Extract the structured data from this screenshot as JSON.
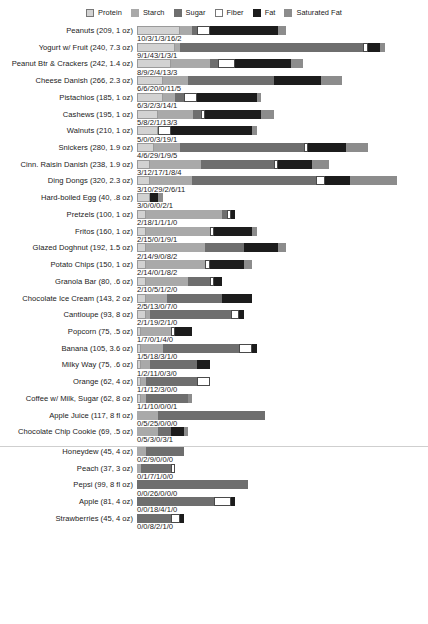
{
  "legend": {
    "items": [
      {
        "label": "Protein",
        "color": "#d2d2d2",
        "key": "protein"
      },
      {
        "label": "Starch",
        "color": "#a9a9a9",
        "key": "starch"
      },
      {
        "label": "Sugar",
        "color": "#6e6e6e",
        "key": "sugar"
      },
      {
        "label": "Fiber",
        "color": "#ffffff",
        "key": "fiber"
      },
      {
        "label": "Fat",
        "color": "#1c1c1c",
        "key": "fat"
      },
      {
        "label": "Saturated Fat",
        "color": "#8c8c8c",
        "key": "satfat"
      }
    ]
  },
  "chart_data": {
    "type": "bar",
    "title": "",
    "subtitle": "",
    "xlabel": "",
    "ylabel": "",
    "orientation": "horizontal",
    "stacked": true,
    "grid": false,
    "legend_position": "top-center",
    "units": "grams",
    "value_separator": "/",
    "px_per_unit": 4.27,
    "series": [
      {
        "name": "Protein",
        "color": "#d2d2d2"
      },
      {
        "name": "Starch",
        "color": "#a9a9a9"
      },
      {
        "name": "Sugar",
        "color": "#6e6e6e"
      },
      {
        "name": "Fiber",
        "color": "#ffffff"
      },
      {
        "name": "Fat",
        "color": "#1c1c1c"
      },
      {
        "name": "Saturated Fat",
        "color": "#8c8c8c"
      }
    ],
    "categories": [
      "Peanuts (209, 1 oz)",
      "Yogurt w/ Fruit (240, 7.3 oz)",
      "Peanut Btr & Crackers (242, 1.4 oz)",
      "Cheese Danish (266, 2.3 oz)",
      "Pistachios (185, 1 oz)",
      "Cashews (195, 1 oz)",
      "Walnuts (210, 1 oz)",
      "Snickers (280, 1.9 oz)",
      "Cinn. Raisin Danish (238, 1.9 oz)",
      "Ding Dongs (320, 2.3 oz)",
      "Hard-boiled Egg (40, .8 oz)",
      "Pretzels (100, 1 oz)",
      "Fritos (160, 1 oz)",
      "Glazed Doghnut (192, 1.5 oz)",
      "Potato Chips (150, 1 oz)",
      "Granola Bar (80, .6 oz)",
      "Chocolate Ice Cream (143, 2 oz)",
      "Cantloupe (93, 8 oz)",
      "Popcorn (75, .5 oz)",
      "Banana (105, 3.6 oz)",
      "Milky Way (75, .6 oz)",
      "Orange (62, 4 oz)",
      "Coffee w/ Milk, Sugar (62, 8 oz)",
      "Apple Juice (117, 8 fl oz)",
      "Chocolate Chip Cookie (69, .5 oz)",
      "Honeydew (45, 4 oz)",
      "Peach (37, 3 oz)",
      "Pepsi (99, 8 fl oz)",
      "Apple (81, 4 oz)",
      "Strawberries (45, 4 oz)"
    ],
    "rows": [
      {
        "label": "Peanuts (209, 1 oz)",
        "values": [
          10,
          3,
          1,
          3,
          16,
          2
        ],
        "value_text": "10/3/1/3/16/2"
      },
      {
        "label": "Yogurt w/ Fruit (240, 7.3 oz)",
        "values": [
          9,
          1,
          43,
          1,
          3,
          1
        ],
        "value_text": "9/1/43/1/3/1"
      },
      {
        "label": "Peanut Btr & Crackers (242, 1.4 oz)",
        "values": [
          8,
          9,
          2,
          4,
          13,
          3
        ],
        "value_text": "8/9/2/4/13/3"
      },
      {
        "label": "Cheese Danish (266, 2.3 oz)",
        "values": [
          6,
          6,
          20,
          0,
          11,
          5
        ],
        "value_text": "6/6/20/0/11/5"
      },
      {
        "label": "Pistachios (185, 1 oz)",
        "values": [
          6,
          3,
          2,
          3,
          14,
          1
        ],
        "value_text": "6/3/2/3/14/1"
      },
      {
        "label": "Cashews (195, 1 oz)",
        "values": [
          5,
          8,
          2,
          1,
          13,
          3
        ],
        "value_text": "5/8/2/1/13/3"
      },
      {
        "label": "Walnuts (210, 1 oz)",
        "values": [
          5,
          0,
          0,
          3,
          19,
          1
        ],
        "value_text": "5/0/0/3/19/1"
      },
      {
        "label": "Snickers (280, 1.9 oz)",
        "values": [
          4,
          6,
          29,
          1,
          9,
          5
        ],
        "value_text": "4/6/29/1/9/5"
      },
      {
        "label": "Cinn. Raisin Danish (238, 1.9 oz)",
        "values": [
          3,
          12,
          17,
          1,
          8,
          4
        ],
        "value_text": "3/12/17/1/8/4"
      },
      {
        "label": "Ding Dongs (320, 2.3 oz)",
        "values": [
          3,
          10,
          29,
          2,
          6,
          11
        ],
        "value_text": "3/10/29/2/6/11"
      },
      {
        "label": "Hard-boiled Egg (40, .8 oz)",
        "values": [
          3,
          0,
          0,
          0,
          2,
          1
        ],
        "value_text": "3/0/0/0/2/1"
      },
      {
        "label": "Pretzels (100, 1 oz)",
        "values": [
          2,
          18,
          1,
          1,
          1,
          0
        ],
        "value_text": "2/18/1/1/1/0"
      },
      {
        "label": "Fritos (160, 1 oz)",
        "values": [
          2,
          15,
          0,
          1,
          9,
          1
        ],
        "value_text": "2/15/0/1/9/1"
      },
      {
        "label": "Glazed Doghnut (192, 1.5 oz)",
        "values": [
          2,
          14,
          9,
          0,
          8,
          2
        ],
        "value_text": "2/14/9/0/8/2"
      },
      {
        "label": "Potato Chips (150, 1 oz)",
        "values": [
          2,
          14,
          0,
          1,
          8,
          2
        ],
        "value_text": "2/14/0/1/8/2"
      },
      {
        "label": "Granola Bar (80, .6 oz)",
        "values": [
          2,
          10,
          5,
          1,
          2,
          0
        ],
        "value_text": "2/10/5/1/2/0"
      },
      {
        "label": "Chocolate Ice Cream (143, 2 oz)",
        "values": [
          2,
          5,
          13,
          0,
          7,
          0
        ],
        "value_text": "2/5/13/0/7/0"
      },
      {
        "label": "Cantloupe (93, 8 oz)",
        "values": [
          2,
          1,
          19,
          2,
          1,
          0
        ],
        "value_text": "2/1/19/2/1/0"
      },
      {
        "label": "Popcorn (75, .5 oz)",
        "values": [
          1,
          7,
          0,
          1,
          4,
          0
        ],
        "value_text": "1/7/0/1/4/0"
      },
      {
        "label": "Banana (105, 3.6 oz)",
        "values": [
          1,
          5,
          18,
          3,
          1,
          0
        ],
        "value_text": "1/5/18/3/1/0"
      },
      {
        "label": "Milky Way (75, .6 oz)",
        "values": [
          1,
          2,
          11,
          0,
          3,
          0
        ],
        "value_text": "1/2/11/0/3/0"
      },
      {
        "label": "Orange (62, 4 oz)",
        "values": [
          1,
          1,
          12,
          3,
          0,
          0
        ],
        "value_text": "1/1/12/3/0/0"
      },
      {
        "label": "Coffee w/ Milk, Sugar (62, 8 oz)",
        "values": [
          1,
          1,
          10,
          0,
          0,
          1
        ],
        "value_text": "1/1/10/0/0/1"
      },
      {
        "label": "Apple Juice (117, 8 fl oz)",
        "values": [
          0,
          5,
          25,
          0,
          0,
          0
        ],
        "value_text": "0/5/25/0/0/0"
      },
      {
        "label": "Chocolate Chip Cookie (69, .5 oz)",
        "values": [
          0,
          5,
          3,
          0,
          3,
          1
        ],
        "value_text": "0/5/3/0/3/1"
      },
      {
        "label": "Honeydew (45, 4 oz)",
        "values": [
          0,
          2,
          9,
          0,
          0,
          0
        ],
        "value_text": "0/2/9/0/0/0"
      },
      {
        "label": "Peach (37, 3 oz)",
        "values": [
          0,
          1,
          7,
          1,
          0,
          0
        ],
        "value_text": "0/1/7/1/0/0"
      },
      {
        "label": "Pepsi (99, 8 fl oz)",
        "values": [
          0,
          0,
          26,
          0,
          0,
          0
        ],
        "value_text": "0/0/26/0/0/0"
      },
      {
        "label": "Apple (81, 4 oz)",
        "values": [
          0,
          0,
          18,
          4,
          1,
          0
        ],
        "value_text": "0/0/18/4/1/0"
      },
      {
        "label": "Strawberries (45, 4 oz)",
        "values": [
          0,
          0,
          8,
          2,
          1,
          0
        ],
        "value_text": "0/0/8/2/1/0"
      }
    ],
    "divider_after_row_index": 24
  }
}
